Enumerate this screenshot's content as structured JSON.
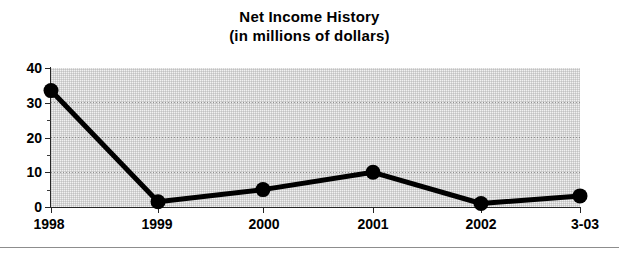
{
  "chart_data": {
    "type": "line",
    "title": "Net Income History",
    "subtitle": "(in millions of dollars)",
    "xlabel": "",
    "ylabel": "",
    "categories": [
      "1998",
      "1999",
      "2000",
      "2001",
      "2002",
      "3-03"
    ],
    "values": [
      33.5,
      1.5,
      5,
      10,
      1,
      3.2
    ],
    "series": [
      {
        "name": "Net Income",
        "values": [
          33.5,
          1.5,
          5,
          10,
          1,
          3.2
        ]
      }
    ],
    "ylim": [
      0,
      40
    ],
    "ytick_labels": [
      "0",
      "10",
      "20",
      "30",
      "40"
    ],
    "ytick_values": [
      0,
      10,
      20,
      30,
      40
    ],
    "yminor_values": [
      5,
      15,
      25,
      35
    ],
    "grid": true,
    "grid_axis": "y",
    "legend": "none",
    "marker": "filled-circle",
    "line_color": "#000000",
    "marker_color": "#000000",
    "plot_background": "#f1f1f1"
  },
  "chart": {
    "title_line1": "Net Income History",
    "title_line2": "(in millions of dollars)",
    "y_axis": {
      "labels": [
        "40",
        "30",
        "20",
        "10",
        "0"
      ]
    },
    "x_axis": {
      "labels": [
        "1998",
        "1999",
        "2000",
        "2001",
        "2002",
        "3-03"
      ]
    }
  }
}
